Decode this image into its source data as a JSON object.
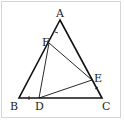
{
  "diagram": {
    "type": "geometry",
    "points": {
      "A": {
        "label": "A",
        "x": 60,
        "y": 20
      },
      "B": {
        "label": "B",
        "x": 19,
        "y": 98
      },
      "C": {
        "label": "C",
        "x": 102,
        "y": 98
      },
      "D": {
        "label": "D",
        "x": 39,
        "y": 98
      },
      "E": {
        "label": "E",
        "x": 92,
        "y": 80
      },
      "F": {
        "label": "F",
        "x": 49,
        "y": 43
      }
    },
    "segments": [
      [
        "A",
        "B"
      ],
      [
        "B",
        "C"
      ],
      [
        "C",
        "A"
      ],
      [
        "D",
        "E"
      ],
      [
        "E",
        "F"
      ],
      [
        "F",
        "D"
      ]
    ],
    "tick_marks": [
      "AF",
      "BD",
      "CE"
    ],
    "labels": {
      "A": "A",
      "B": "B",
      "C": "C",
      "D": "D",
      "E": "E",
      "F": "F"
    }
  }
}
